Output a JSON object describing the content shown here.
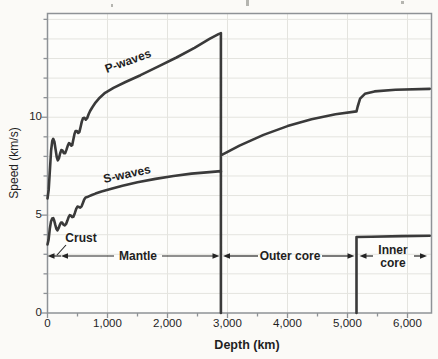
{
  "figure": {
    "bg_color": "#fbfaf7",
    "plot_bg_color": "#fdfdfb",
    "frame_color": "#8e9296",
    "grid_color": "#e4e4df",
    "curve_color": "#3a3a3a",
    "annotation_color": "#242424",
    "text_color": "#1f1f1f",
    "artifact_color": "#b5b5b0"
  },
  "chart_data": {
    "type": "line",
    "title": "",
    "xlabel": "Depth (km)",
    "ylabel": "Speed (km/s)",
    "xlim": [
      0,
      6400
    ],
    "ylim": [
      0,
      15.3
    ],
    "grid": "on",
    "grid_x_interval_km": 1000,
    "grid_y_interval_kms": 1,
    "x_ticks": [
      {
        "value": 0,
        "label": "0"
      },
      {
        "value": 1000,
        "label": "1,000"
      },
      {
        "value": 2000,
        "label": "2,000"
      },
      {
        "value": 3000,
        "label": "3,000"
      },
      {
        "value": 4000,
        "label": "4,000"
      },
      {
        "value": 5000,
        "label": "5,000"
      },
      {
        "value": 6000,
        "label": "6,000"
      }
    ],
    "x_minor_ticks": [
      500,
      1500,
      2500,
      3500,
      4500,
      5500
    ],
    "y_ticks": [
      {
        "value": 0,
        "label": "0"
      },
      {
        "value": 5,
        "label": "5"
      },
      {
        "value": 10,
        "label": "10"
      }
    ],
    "y_minor_ticks": [
      1,
      2,
      3,
      4,
      6,
      7,
      8,
      9,
      11,
      12,
      13,
      14,
      15
    ],
    "series": [
      {
        "name": "P-waves",
        "points": [
          [
            0,
            5.85
          ],
          [
            20,
            6.3
          ],
          [
            40,
            7.3
          ],
          [
            60,
            8.3
          ],
          [
            80,
            8.8
          ],
          [
            95,
            8.9
          ],
          [
            115,
            8.75
          ],
          [
            135,
            8.35
          ],
          [
            155,
            7.95
          ],
          [
            172,
            7.8
          ],
          [
            190,
            7.9
          ],
          [
            210,
            8.15
          ],
          [
            230,
            8.32
          ],
          [
            250,
            8.3
          ],
          [
            272,
            8.17
          ],
          [
            295,
            8.17
          ],
          [
            315,
            8.33
          ],
          [
            338,
            8.55
          ],
          [
            358,
            8.68
          ],
          [
            378,
            8.63
          ],
          [
            398,
            8.55
          ],
          [
            412,
            8.57
          ],
          [
            430,
            8.85
          ],
          [
            450,
            9.15
          ],
          [
            468,
            9.3
          ],
          [
            490,
            9.3
          ],
          [
            512,
            9.2
          ],
          [
            532,
            9.25
          ],
          [
            552,
            9.5
          ],
          [
            572,
            9.78
          ],
          [
            592,
            9.95
          ],
          [
            615,
            9.97
          ],
          [
            638,
            9.88
          ],
          [
            660,
            9.95
          ],
          [
            685,
            10.15
          ],
          [
            710,
            10.32
          ],
          [
            745,
            10.5
          ],
          [
            800,
            10.75
          ],
          [
            870,
            11.0
          ],
          [
            960,
            11.25
          ],
          [
            1100,
            11.5
          ],
          [
            1300,
            11.8
          ],
          [
            1550,
            12.15
          ],
          [
            1850,
            12.6
          ],
          [
            2150,
            13.05
          ],
          [
            2450,
            13.55
          ],
          [
            2700,
            14.0
          ],
          [
            2850,
            14.25
          ],
          [
            2890,
            14.3
          ],
          [
            2890,
            7.2
          ],
          [
            2890,
            8.05
          ],
          [
            3200,
            8.55
          ],
          [
            3600,
            9.1
          ],
          [
            4000,
            9.55
          ],
          [
            4400,
            9.9
          ],
          [
            4800,
            10.15
          ],
          [
            5150,
            10.3
          ],
          [
            5170,
            10.55
          ],
          [
            5210,
            10.95
          ],
          [
            5290,
            11.2
          ],
          [
            5450,
            11.32
          ],
          [
            5800,
            11.4
          ],
          [
            6370,
            11.45
          ]
        ]
      },
      {
        "name": "S-waves",
        "points": [
          [
            0,
            3.5
          ],
          [
            18,
            3.75
          ],
          [
            38,
            4.3
          ],
          [
            58,
            4.68
          ],
          [
            78,
            4.83
          ],
          [
            95,
            4.85
          ],
          [
            112,
            4.72
          ],
          [
            130,
            4.5
          ],
          [
            148,
            4.3
          ],
          [
            165,
            4.22
          ],
          [
            185,
            4.33
          ],
          [
            205,
            4.5
          ],
          [
            225,
            4.62
          ],
          [
            245,
            4.62
          ],
          [
            265,
            4.52
          ],
          [
            288,
            4.48
          ],
          [
            310,
            4.55
          ],
          [
            332,
            4.72
          ],
          [
            352,
            4.9
          ],
          [
            372,
            5.0
          ],
          [
            392,
            4.97
          ],
          [
            412,
            4.9
          ],
          [
            432,
            4.92
          ],
          [
            455,
            5.1
          ],
          [
            478,
            5.32
          ],
          [
            500,
            5.44
          ],
          [
            522,
            5.42
          ],
          [
            545,
            5.38
          ],
          [
            568,
            5.45
          ],
          [
            590,
            5.62
          ],
          [
            612,
            5.8
          ],
          [
            635,
            5.9
          ],
          [
            662,
            5.92
          ],
          [
            695,
            5.97
          ],
          [
            740,
            6.03
          ],
          [
            800,
            6.1
          ],
          [
            900,
            6.2
          ],
          [
            1050,
            6.33
          ],
          [
            1250,
            6.5
          ],
          [
            1500,
            6.68
          ],
          [
            1800,
            6.85
          ],
          [
            2100,
            7.0
          ],
          [
            2400,
            7.12
          ],
          [
            2700,
            7.2
          ],
          [
            2890,
            7.25
          ],
          [
            2890,
            0
          ]
        ]
      },
      {
        "name": "S-waves (inner core)",
        "points": [
          [
            5150,
            0
          ],
          [
            5150,
            3.88
          ],
          [
            5400,
            3.9
          ],
          [
            5900,
            3.93
          ],
          [
            6370,
            3.95
          ]
        ]
      }
    ],
    "layer_boundaries_km": {
      "crust_mantle": 40,
      "core_mantle": 2890,
      "inner_core": 5150,
      "earth_center": 6370
    },
    "annotations": {
      "p_label": {
        "text": "P-waves",
        "x_px": 128,
        "y_px": 61,
        "rotate_deg": -20
      },
      "s_label": {
        "text": "S-waves",
        "x_px": 127,
        "y_px": 174,
        "rotate_deg": -12
      },
      "crust": {
        "text": "Crust",
        "label_x_px": 81,
        "label_y_px": 238,
        "pointer": [
          [
            66,
            245
          ],
          [
            57,
            255
          ]
        ],
        "arrow": {
          "tip_px": 47.5,
          "tail_px": 58,
          "y_px": 256
        }
      },
      "regions": [
        {
          "text": "Mantle",
          "x1_px": 61,
          "x2_px": 219.5,
          "y_px": 256,
          "gap": [
            114,
            162
          ],
          "label_x_px": 138,
          "label_y_px": 256
        },
        {
          "text": "Outer core",
          "x1_px": 223,
          "x2_px": 354.5,
          "y_px": 256,
          "gap": [
            258,
            322
          ],
          "label_x_px": 290,
          "label_y_px": 256
        },
        {
          "text": "Inner core",
          "lines": [
            "Inner",
            "core"
          ],
          "x1_px": 359.5,
          "x2_px": 427,
          "y_px": 256,
          "gap": [
            373,
            414
          ],
          "label_x_px": 393,
          "label_y_px": 257
        }
      ]
    },
    "artifacts": [
      {
        "x": 246,
        "y": 0,
        "w": 3,
        "h": 6
      },
      {
        "x": 111,
        "y": 4,
        "w": 2,
        "h": 3
      },
      {
        "x": 401,
        "y": 1,
        "w": 3,
        "h": 3
      }
    ]
  }
}
